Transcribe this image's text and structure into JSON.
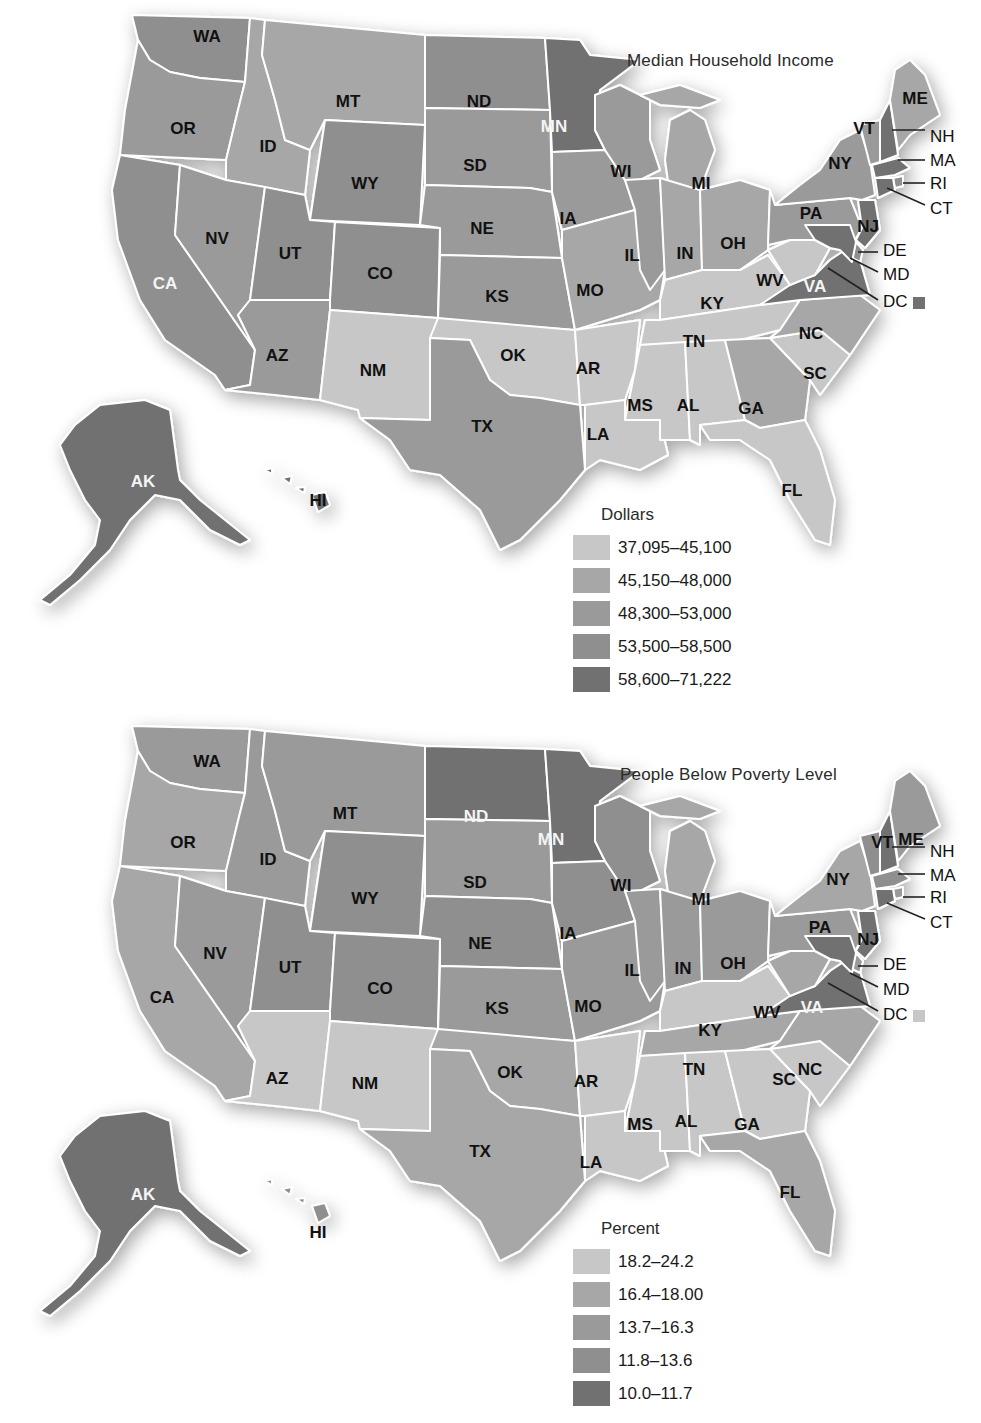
{
  "palette": {
    "c1": "#c7c7c7",
    "c2": "#a7a7a7",
    "c3": "#9a9a9a",
    "c4": "#8f8f8f",
    "c5": "#717171"
  },
  "maps": [
    {
      "title": "Median Household Income",
      "legend": {
        "title": "Dollars",
        "items": [
          {
            "label": "37,095–45,100",
            "class": "c1"
          },
          {
            "label": "45,150–48,000",
            "class": "c2"
          },
          {
            "label": "48,300–53,000",
            "class": "c3"
          },
          {
            "label": "53,500–58,500",
            "class": "c4"
          },
          {
            "label": "58,600–71,222",
            "class": "c5"
          }
        ]
      },
      "states": {
        "WA": "c4",
        "OR": "c3",
        "CA": "c4",
        "NV": "c3",
        "ID": "c2",
        "MT": "c2",
        "WY": "c4",
        "UT": "c4",
        "CO": "c4",
        "AZ": "c3",
        "NM": "c1",
        "ND": "c4",
        "SD": "c3",
        "NE": "c3",
        "KS": "c3",
        "OK": "c1",
        "TX": "c3",
        "MN": "c5",
        "IA": "c3",
        "MO": "c2",
        "AR": "c1",
        "LA": "c1",
        "WI": "c3",
        "IL": "c3",
        "MI": "c2",
        "IN": "c2",
        "OH": "c2",
        "KY": "c1",
        "TN": "c1",
        "MS": "c1",
        "AL": "c1",
        "GA": "c2",
        "FL": "c1",
        "SC": "c1",
        "NC": "c2",
        "VA": "c5",
        "WV": "c1",
        "PA": "c3",
        "NY": "c3",
        "VT": "c3",
        "NH": "c5",
        "ME": "c2",
        "MA": "c5",
        "RI": "c4",
        "CT": "c5",
        "NJ": "c5",
        "DE": "c4",
        "MD": "c5",
        "AK": "c5",
        "HI": "c5",
        "DC": "c5"
      },
      "label_light": [
        "MN",
        "VA",
        "CA",
        "AK"
      ]
    },
    {
      "title": "People Below Poverty Level",
      "legend": {
        "title": "Percent",
        "items": [
          {
            "label": "18.2–24.2",
            "class": "c1"
          },
          {
            "label": "16.4–18.00",
            "class": "c2"
          },
          {
            "label": "13.7–16.3",
            "class": "c3"
          },
          {
            "label": "11.8–13.6",
            "class": "c4"
          },
          {
            "label": "10.0–11.7",
            "class": "c5"
          }
        ]
      },
      "states": {
        "WA": "c3",
        "OR": "c2",
        "CA": "c2",
        "NV": "c3",
        "ID": "c3",
        "MT": "c3",
        "WY": "c4",
        "UT": "c4",
        "CO": "c4",
        "AZ": "c1",
        "NM": "c1",
        "ND": "c5",
        "SD": "c3",
        "NE": "c4",
        "KS": "c3",
        "OK": "c2",
        "TX": "c2",
        "MN": "c5",
        "IA": "c4",
        "MO": "c3",
        "AR": "c1",
        "LA": "c1",
        "WI": "c4",
        "IL": "c3",
        "MI": "c2",
        "IN": "c3",
        "OH": "c3",
        "KY": "c1",
        "TN": "c2",
        "MS": "c1",
        "AL": "c1",
        "GA": "c1",
        "FL": "c2",
        "SC": "c1",
        "NC": "c2",
        "VA": "c5",
        "WV": "c2",
        "PA": "c3",
        "NY": "c2",
        "VT": "c4",
        "NH": "c5",
        "ME": "c3",
        "MA": "c4",
        "RI": "c3",
        "CT": "c5",
        "NJ": "c5",
        "DE": "c3",
        "MD": "c5",
        "AK": "c5",
        "HI": "c4",
        "DC": "c1"
      },
      "label_light": [
        "ND",
        "MN",
        "VA",
        "AK"
      ]
    }
  ],
  "state_labels": {
    "WA": "WA",
    "OR": "OR",
    "CA": "CA",
    "NV": "NV",
    "ID": "ID",
    "MT": "MT",
    "WY": "WY",
    "UT": "UT",
    "CO": "CO",
    "AZ": "AZ",
    "NM": "NM",
    "ND": "ND",
    "SD": "SD",
    "NE": "NE",
    "KS": "KS",
    "OK": "OK",
    "TX": "TX",
    "MN": "MN",
    "IA": "IA",
    "MO": "MO",
    "AR": "AR",
    "LA": "LA",
    "WI": "WI",
    "IL": "IL",
    "MI": "MI",
    "IN": "IN",
    "OH": "OH",
    "KY": "KY",
    "TN": "TN",
    "MS": "MS",
    "AL": "AL",
    "GA": "GA",
    "FL": "FL",
    "SC": "SC",
    "NC": "NC",
    "VA": "VA",
    "WV": "WV",
    "PA": "PA",
    "NY": "NY",
    "VT": "VT",
    "ME": "ME",
    "AK": "AK",
    "HI": "HI",
    "NH": "NH",
    "MA": "MA",
    "RI": "RI",
    "CT": "CT",
    "NJ": "NJ",
    "DE": "DE",
    "MD": "MD",
    "DC": "DC"
  }
}
